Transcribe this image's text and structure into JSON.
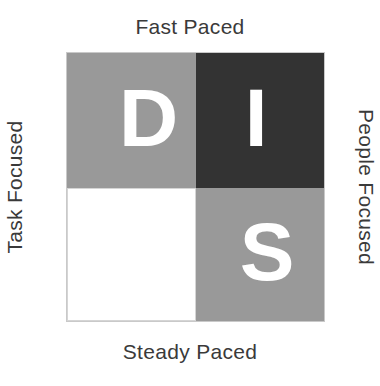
{
  "diagram": {
    "axes": {
      "top": "Fast Paced",
      "bottom": "Steady Paced",
      "left": "Task Focused",
      "right": "People Focused"
    },
    "quadrants": [
      {
        "id": "D",
        "letter": "D",
        "position": "top-left",
        "pace": "Fast Paced",
        "focus": "Task Focused",
        "background_color": "#999999",
        "letter_color": "#ffffff",
        "letter_visible": true
      },
      {
        "id": "I",
        "letter": "I",
        "position": "top-right",
        "pace": "Fast Paced",
        "focus": "People Focused",
        "background_color": "#333333",
        "letter_color": "#ffffff",
        "letter_visible": true
      },
      {
        "id": "C",
        "letter": "C",
        "position": "bottom-left",
        "pace": "Steady Paced",
        "focus": "Task Focused",
        "background_color": "#ffffff",
        "letter_color": "#ffffff",
        "letter_visible": false
      },
      {
        "id": "S",
        "letter": "S",
        "position": "bottom-right",
        "pace": "Steady Paced",
        "focus": "People Focused",
        "background_color": "#999999",
        "letter_color": "#ffffff",
        "letter_visible": true
      }
    ],
    "colors": {
      "medium_gray": "#999999",
      "dark_charcoal": "#333333",
      "white": "#ffffff",
      "label_text": "#3a3a3a",
      "border": "#c9c9c9",
      "page_background": "#ffffff"
    }
  }
}
